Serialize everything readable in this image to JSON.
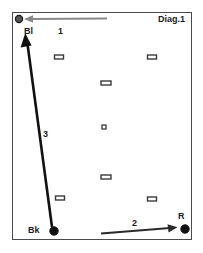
{
  "diagram": {
    "title": "Diag.1",
    "field": {
      "x": 12,
      "y": 12,
      "width": 180,
      "height": 228,
      "border_color": "#4a4a4a"
    },
    "markers": [
      {
        "name": "Bl",
        "label": "Bl",
        "type": "circle",
        "fill": "#555555",
        "stroke": "#1a1a1a",
        "cx": 19,
        "cy": 19,
        "r": 3.6
      },
      {
        "name": "Bk",
        "label": "Bk",
        "type": "circle",
        "fill": "#111111",
        "stroke": "#111111",
        "cx": 54,
        "cy": 231,
        "r": 4.2
      },
      {
        "name": "R",
        "label": "R",
        "type": "circle",
        "fill": "#111111",
        "stroke": "#111111",
        "cx": 185,
        "cy": 229,
        "r": 4.2
      }
    ],
    "pins": [
      {
        "cx": 59,
        "cy": 57,
        "w": 9,
        "h": 4
      },
      {
        "cx": 152,
        "cy": 57,
        "w": 9,
        "h": 4
      },
      {
        "cx": 106,
        "cy": 83,
        "w": 10,
        "h": 4
      },
      {
        "cx": 104,
        "cy": 127,
        "w": 4,
        "h": 4
      },
      {
        "cx": 106,
        "cy": 177,
        "w": 10,
        "h": 4
      },
      {
        "cx": 60,
        "cy": 198,
        "w": 9,
        "h": 4
      },
      {
        "cx": 152,
        "cy": 199,
        "w": 9,
        "h": 4
      }
    ],
    "arrows": [
      {
        "id": "1",
        "label": "1",
        "color": "#8a8a8a",
        "width": 2.0,
        "x1": 107,
        "y1": 18,
        "x2": 28,
        "y2": 19,
        "head": "end"
      },
      {
        "id": "2",
        "label": "2",
        "color": "#2a2a2a",
        "width": 2.0,
        "x1": 101,
        "y1": 233,
        "x2": 176,
        "y2": 227,
        "head": "end"
      },
      {
        "id": "3",
        "label": "3",
        "color": "#111111",
        "width": 2.6,
        "x1": 52,
        "y1": 227,
        "x2": 25,
        "y2": 37,
        "head": "end"
      }
    ]
  }
}
